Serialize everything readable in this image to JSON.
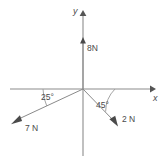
{
  "figure": {
    "background_color": "#ffffff",
    "axis_color": "#8c8c8c",
    "vector_color": "#8a8a8a",
    "text_color": "#4a4a4a"
  },
  "axes": {
    "x_label": "x",
    "y_label": "y",
    "origin": {
      "x": 83,
      "y": 89
    },
    "x_start": {
      "x": 10,
      "y": 89
    },
    "x_end": {
      "x": 153,
      "y": 89
    },
    "y_top": {
      "x": 83,
      "y": 12
    },
    "y_bottom": {
      "x": 83,
      "y": 156
    }
  },
  "vectors": [
    {
      "name": "force-8n",
      "label": "8N",
      "magnitude": 8,
      "unit": "N",
      "angle_deg": 90,
      "direction": "up along positive y-axis",
      "tip": {
        "x": 83,
        "y": 39
      },
      "label_pos": {
        "x": 88,
        "y": 50
      }
    },
    {
      "name": "force-7n",
      "label": "7 N",
      "magnitude": 7,
      "unit": "N",
      "angle_deg": 205,
      "direction": "down-left, 25 degrees below negative x-axis",
      "tip": {
        "x": 13,
        "y": 122
      },
      "label_pos": {
        "x": 25,
        "y": 130
      }
    },
    {
      "name": "force-2n",
      "label": "2 N",
      "magnitude": 2,
      "unit": "N",
      "angle_deg": -45,
      "direction": "down-right, 45 degrees below positive x-axis",
      "tip": {
        "x": 117,
        "y": 124
      },
      "label_pos": {
        "x": 123,
        "y": 122
      }
    }
  ],
  "angles": [
    {
      "name": "angle-25",
      "label": "25°",
      "value": 25,
      "unit": "degrees",
      "between": "negative x-axis and 7 N vector",
      "label_pos": {
        "x": 42,
        "y": 99
      }
    },
    {
      "name": "angle-45",
      "label": "45°",
      "value": 45,
      "unit": "degrees",
      "between": "positive x-axis and 2 N vector",
      "label_pos": {
        "x": 97,
        "y": 107
      }
    }
  ]
}
